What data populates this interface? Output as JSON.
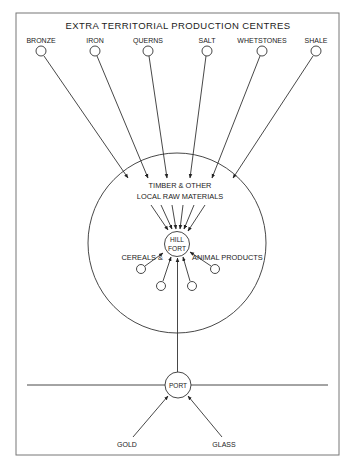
{
  "diagram": {
    "title": "EXTRA TERRITORIAL PRODUCTION CENTRES",
    "production_centres": [
      {
        "label": "BRONZE",
        "x": 41
      },
      {
        "label": "IRON",
        "x": 95
      },
      {
        "label": "QUERNS",
        "x": 148
      },
      {
        "label": "SALT",
        "x": 207
      },
      {
        "label": "WHETSTONES",
        "x": 262
      },
      {
        "label": "SHALE",
        "x": 316
      }
    ],
    "local_materials": {
      "line1": "TIMBER & OTHER",
      "line2": "LOCAL RAW MATERIALS"
    },
    "hill_fort": {
      "line1": "HILL",
      "line2": "FORT"
    },
    "cereals_label": "CEREALS &",
    "animal_products_label": "ANIMAL PRODUCTS",
    "port_label": "PORT",
    "imports": [
      {
        "label": "GOLD"
      },
      {
        "label": "GLASS"
      }
    ],
    "colors": {
      "line": "#333333",
      "frame": "#777777",
      "background": "#ffffff"
    }
  }
}
